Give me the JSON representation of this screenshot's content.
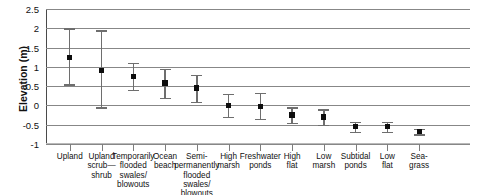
{
  "chart_data": {
    "type": "scatter",
    "title": "",
    "xlabel": "",
    "ylabel": "Elevation (m)",
    "ylim": [
      -1,
      2.5
    ],
    "yticks": [
      2.5,
      2,
      1.5,
      1,
      0.5,
      0,
      -0.5,
      -1
    ],
    "ytick_labels": [
      "2.5",
      "2",
      "1.5",
      "1",
      "0.5",
      "0",
      "-0.5",
      "-1"
    ],
    "grid": true,
    "legend": "none",
    "error_bars": "vertical range bars with caps",
    "categories": [
      "Upland",
      "Upland scrub—shrub",
      "Temporarily flooded swales/ blowouts",
      "Ocean beach",
      "Semi-permanently flooded swales/ blowouts",
      "High marsh",
      "Freshwater ponds",
      "High flat",
      "Low marsh",
      "Subtidal ponds",
      "Low flat",
      "Sea-grass"
    ],
    "category_lines": [
      [
        "Upland"
      ],
      [
        "Upland",
        "scrub—",
        "shrub"
      ],
      [
        "Temporarily",
        "flooded",
        "swales/",
        "blowouts"
      ],
      [
        "Ocean",
        "beach"
      ],
      [
        "Semi-",
        "permanently",
        "flooded swales/",
        "blowouts"
      ],
      [
        "High",
        "marsh"
      ],
      [
        "Freshwater",
        "ponds"
      ],
      [
        "High",
        "flat"
      ],
      [
        "Low",
        "marsh"
      ],
      [
        "Subtidal",
        "ponds"
      ],
      [
        "Low",
        "flat"
      ],
      [
        "Sea-",
        "grass"
      ]
    ],
    "values": [
      1.25,
      0.9,
      0.75,
      0.58,
      0.45,
      0.0,
      -0.02,
      -0.25,
      -0.3,
      -0.55,
      -0.55,
      -0.67
    ],
    "upper": [
      2.0,
      1.95,
      1.1,
      0.95,
      0.8,
      0.3,
      0.32,
      -0.05,
      -0.1,
      -0.42,
      -0.42,
      -0.6
    ],
    "lower": [
      0.55,
      -0.05,
      0.4,
      0.2,
      0.1,
      -0.3,
      -0.35,
      -0.45,
      -0.5,
      -0.68,
      -0.68,
      -0.75
    ],
    "n_points": 12,
    "colors": {
      "marker": "#0d0d0d",
      "error_bar": "#6e6e6e",
      "gridline": "#878787",
      "axis": "#4a4a4a",
      "background": "#ffffff",
      "text": "#111111"
    }
  }
}
